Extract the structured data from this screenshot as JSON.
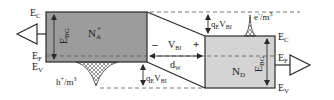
{
  "diagram": {
    "colors": {
      "p_region": "#9c9c9c",
      "n_region": "#d4d4d4",
      "line": "#2a2a2a",
      "dashed": "#555555",
      "background": "#ffffff"
    },
    "p_side": {
      "ec_label": "E",
      "ec_sub": "C",
      "ef_label": "E",
      "ef_sub": "F",
      "ev_label": "E",
      "ev_sub": "V",
      "doping_label": "N",
      "doping_sub": "A",
      "doping_sup": "+",
      "bandgap_label": "E",
      "bandgap_sub": "BG",
      "carrier_label": "h",
      "carrier_sup": "+",
      "carrier_unit": "/m",
      "carrier_unit_sup": "3"
    },
    "n_side": {
      "ec_label": "E",
      "ec_sub": "C",
      "ef_label": "E",
      "ef_sub": "F",
      "ev_label": "E",
      "ev_sub": "V",
      "doping_label": "N",
      "doping_sub": "D",
      "bandgap_label": "E",
      "bandgap_sub": "BG",
      "carrier_label": "e",
      "carrier_sup": "-",
      "carrier_unit": "/m",
      "carrier_unit_sup": "3"
    },
    "junction": {
      "minus_sign": "–",
      "plus_sign": "+",
      "vbi_label": "V",
      "vbi_sub": "BI",
      "width_label": "d",
      "width_sub": "W",
      "barrier_top_q": "q",
      "barrier_top_q_sub": "E",
      "barrier_top_v": "V",
      "barrier_top_v_sub": "BI",
      "barrier_bottom_q": "q",
      "barrier_bottom_q_sub": "E",
      "barrier_bottom_v": "V",
      "barrier_bottom_v_sub": "BI"
    }
  }
}
